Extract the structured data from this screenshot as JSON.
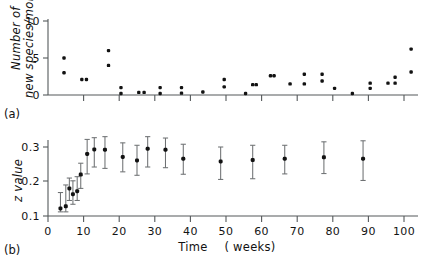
{
  "figure": {
    "panel_a_label": "(a)",
    "panel_b_label": "(b)"
  },
  "panel_a": {
    "ylabel_line1": "Number of",
    "ylabel_line2": "new species/month",
    "y_ticks": [
      "0",
      "5",
      "10"
    ]
  },
  "panel_b": {
    "ylabel": "z value",
    "xlabel_main": "Time",
    "xlabel_units": "( weeks)",
    "y_ticks": [
      "0.1",
      "0.2",
      "0.3"
    ],
    "x_ticks": [
      "0",
      "10",
      "20",
      "30",
      "40",
      "50",
      "60",
      "70",
      "80",
      "90",
      "100"
    ]
  },
  "colors": {
    "marker": "#121212",
    "errorbar": "#6e7173",
    "axis": "#55595b",
    "background": "#ffffff"
  },
  "chart_data": [
    {
      "type": "scatter",
      "panel": "(a)",
      "title": "",
      "xlabel": "",
      "ylabel": "Number of new species/month",
      "xlim": [
        0,
        104
      ],
      "ylim": [
        0,
        10
      ],
      "grid": false,
      "legend": "none",
      "points": [
        {
          "x": 4.5,
          "y": 5.0
        },
        {
          "x": 4.5,
          "y": 3.0
        },
        {
          "x": 9.5,
          "y": 2.1
        },
        {
          "x": 10.8,
          "y": 2.1
        },
        {
          "x": 17.0,
          "y": 6.0
        },
        {
          "x": 17.0,
          "y": 4.0
        },
        {
          "x": 20.5,
          "y": 1.0
        },
        {
          "x": 20.5,
          "y": 0.2
        },
        {
          "x": 25.5,
          "y": 0.35
        },
        {
          "x": 27.0,
          "y": 0.35
        },
        {
          "x": 31.5,
          "y": 1.0
        },
        {
          "x": 31.5,
          "y": 0.2
        },
        {
          "x": 37.5,
          "y": 1.0
        },
        {
          "x": 37.5,
          "y": 0.25
        },
        {
          "x": 43.5,
          "y": 0.4
        },
        {
          "x": 49.5,
          "y": 2.1
        },
        {
          "x": 49.5,
          "y": 1.1
        },
        {
          "x": 55.5,
          "y": 0.2
        },
        {
          "x": 57.5,
          "y": 1.4
        },
        {
          "x": 58.5,
          "y": 1.4
        },
        {
          "x": 62.5,
          "y": 2.6
        },
        {
          "x": 63.5,
          "y": 2.6
        },
        {
          "x": 68.0,
          "y": 1.5
        },
        {
          "x": 72.0,
          "y": 2.8
        },
        {
          "x": 72.0,
          "y": 1.5
        },
        {
          "x": 77.0,
          "y": 2.8
        },
        {
          "x": 77.0,
          "y": 1.9
        },
        {
          "x": 80.5,
          "y": 0.9
        },
        {
          "x": 85.5,
          "y": 0.2
        },
        {
          "x": 90.5,
          "y": 1.6
        },
        {
          "x": 90.5,
          "y": 0.9
        },
        {
          "x": 95.5,
          "y": 1.6
        },
        {
          "x": 97.5,
          "y": 2.4
        },
        {
          "x": 97.5,
          "y": 1.6
        },
        {
          "x": 102.0,
          "y": 6.2
        },
        {
          "x": 102.0,
          "y": 3.1
        }
      ]
    },
    {
      "type": "scatter",
      "panel": "(b)",
      "title": "",
      "xlabel": "Time ( weeks)",
      "ylabel": "z value",
      "xlim": [
        0,
        104
      ],
      "ylim": [
        0.1,
        0.33
      ],
      "grid": false,
      "legend": "none",
      "errorbars": true,
      "points": [
        {
          "x": 3.5,
          "y": 0.122,
          "err_low": 0.112,
          "err_high": 0.168
        },
        {
          "x": 5.0,
          "y": 0.128,
          "err_low": 0.112,
          "err_high": 0.19
        },
        {
          "x": 6.0,
          "y": 0.18,
          "err_low": 0.145,
          "err_high": 0.21
        },
        {
          "x": 7.0,
          "y": 0.163,
          "err_low": 0.134,
          "err_high": 0.202
        },
        {
          "x": 8.2,
          "y": 0.172,
          "err_low": 0.145,
          "err_high": 0.214
        },
        {
          "x": 9.2,
          "y": 0.22,
          "err_low": 0.18,
          "err_high": 0.253
        },
        {
          "x": 11.0,
          "y": 0.28,
          "err_low": 0.222,
          "err_high": 0.322
        },
        {
          "x": 13.0,
          "y": 0.293,
          "err_low": 0.242,
          "err_high": 0.327
        },
        {
          "x": 16.0,
          "y": 0.292,
          "err_low": 0.238,
          "err_high": 0.33
        },
        {
          "x": 21.0,
          "y": 0.271,
          "err_low": 0.228,
          "err_high": 0.312
        },
        {
          "x": 25.0,
          "y": 0.261,
          "err_low": 0.218,
          "err_high": 0.305
        },
        {
          "x": 28.0,
          "y": 0.295,
          "err_low": 0.242,
          "err_high": 0.33
        },
        {
          "x": 33.0,
          "y": 0.292,
          "err_low": 0.24,
          "err_high": 0.326
        },
        {
          "x": 38.0,
          "y": 0.266,
          "err_low": 0.221,
          "err_high": 0.308
        },
        {
          "x": 48.5,
          "y": 0.258,
          "err_low": 0.206,
          "err_high": 0.3
        },
        {
          "x": 57.5,
          "y": 0.262,
          "err_low": 0.208,
          "err_high": 0.305
        },
        {
          "x": 66.5,
          "y": 0.266,
          "err_low": 0.222,
          "err_high": 0.305
        },
        {
          "x": 77.5,
          "y": 0.27,
          "err_low": 0.223,
          "err_high": 0.315
        },
        {
          "x": 88.5,
          "y": 0.266,
          "err_low": 0.203,
          "err_high": 0.318
        }
      ]
    }
  ]
}
